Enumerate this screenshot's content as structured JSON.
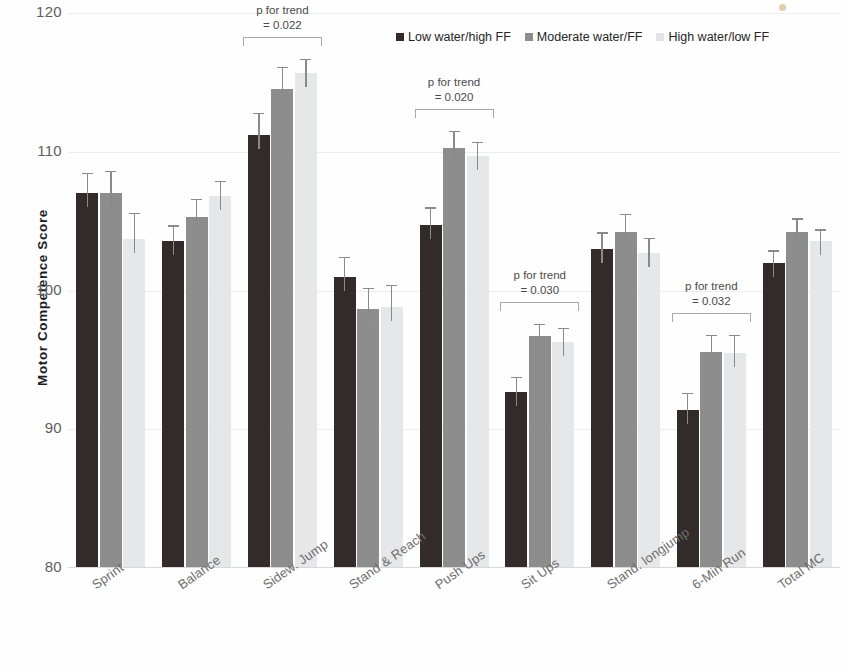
{
  "chart_data": {
    "type": "bar",
    "title": "",
    "xlabel": "",
    "ylabel": "Motor Competence  Score",
    "ylim": [
      80,
      120
    ],
    "yticks": [
      80,
      90,
      100,
      110,
      120
    ],
    "grid": true,
    "legend_position": "top-right",
    "categories": [
      "Sprint",
      "Balance",
      "Sidew. Jump",
      "Stand & Reach",
      "Push Ups",
      "Sit Ups",
      "Stand. longjump",
      "6-Min Run",
      "Total MC"
    ],
    "series": [
      {
        "name": "Low water/high FF",
        "color": "#332b29",
        "values": [
          107.0,
          103.6,
          111.2,
          101.0,
          104.7,
          92.7,
          103.0,
          91.4,
          102.0
        ],
        "errors": [
          1.5,
          1.1,
          1.6,
          1.4,
          1.3,
          1.1,
          1.2,
          1.2,
          0.9
        ]
      },
      {
        "name": "Moderate water/FF",
        "color": "#8d8d8d",
        "values": [
          107.0,
          105.3,
          114.5,
          98.7,
          110.3,
          96.7,
          104.2,
          95.6,
          104.2
        ],
        "errors": [
          1.6,
          1.3,
          1.6,
          1.5,
          1.2,
          0.9,
          1.3,
          1.2,
          1.0
        ]
      },
      {
        "name": "High water/low FF",
        "color": "#e6e7e9",
        "values": [
          103.7,
          106.8,
          115.7,
          98.8,
          109.7,
          96.3,
          102.7,
          95.5,
          103.6
        ],
        "errors": [
          1.9,
          1.1,
          1.0,
          1.6,
          1.0,
          1.0,
          1.1,
          1.3,
          0.8
        ]
      }
    ],
    "annotations": [
      {
        "category": "Sidew. Jump",
        "line1": "p for trend",
        "line2": "= 0.022",
        "p_value": 0.022
      },
      {
        "category": "Push Ups",
        "line1": "p for trend",
        "line2": "= 0.020",
        "p_value": 0.02
      },
      {
        "category": "Sit Ups",
        "line1": "p for trend",
        "line2": "= 0.030",
        "p_value": 0.03
      },
      {
        "category": "6-Min Run",
        "line1": "p for trend",
        "line2": "= 0.032",
        "p_value": 0.032
      }
    ]
  },
  "legend": {
    "items": [
      {
        "label": "Low water/high FF"
      },
      {
        "label": "Moderate water/FF"
      },
      {
        "label": "High water/low FF"
      }
    ]
  }
}
